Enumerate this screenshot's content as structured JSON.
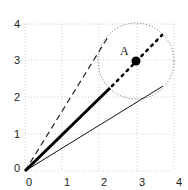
{
  "diagram": {
    "type": "vector-plot",
    "x_ticks": [
      "0",
      "1",
      "2",
      "3",
      "4"
    ],
    "y_ticks": [
      "0",
      "1",
      "2",
      "3",
      "4"
    ],
    "point_label": "A",
    "point": [
      2.9,
      2.9
    ],
    "circle_radius": 1.0,
    "lines": [
      {
        "name": "thick-solid",
        "from": [
          0,
          0
        ],
        "to": [
          2.1,
          2.1
        ]
      },
      {
        "name": "dotted-extension",
        "from": [
          2.1,
          2.1
        ],
        "to": [
          3.6,
          3.6
        ]
      },
      {
        "name": "dashed",
        "from": [
          0,
          0
        ],
        "to": [
          2.2,
          3.6
        ]
      },
      {
        "name": "thin-solid",
        "from": [
          0,
          0
        ],
        "to": [
          3.6,
          2.2
        ]
      }
    ],
    "colors": {
      "line": "#000000",
      "grid": "#cccccc"
    }
  }
}
